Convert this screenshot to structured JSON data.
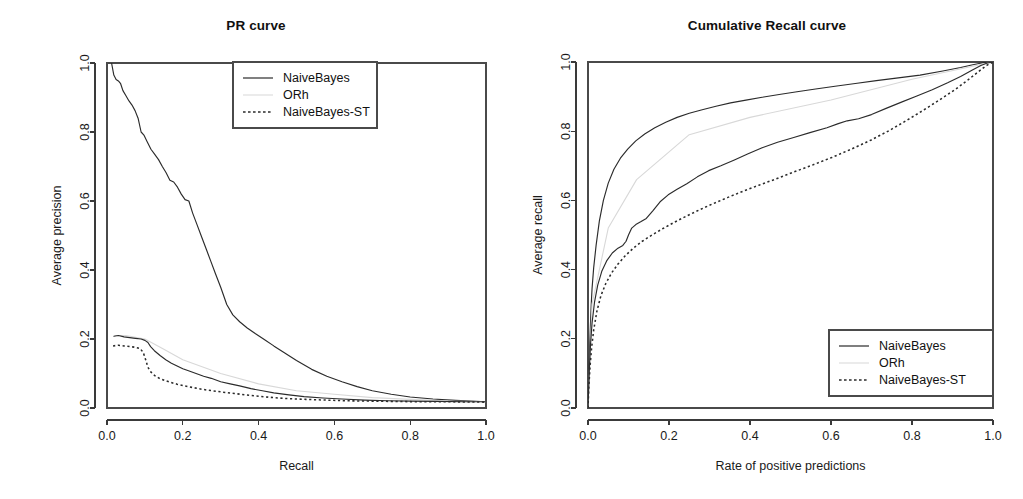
{
  "figure": {
    "background": "#ffffff",
    "foreground": "#1a1a1a",
    "panels": 2
  },
  "chart_data": [
    {
      "type": "line",
      "title": "PR curve",
      "xlabel": "Recall",
      "ylabel": "Average precision",
      "xlim": [
        0.0,
        1.0
      ],
      "ylim": [
        0.0,
        1.0
      ],
      "xticks": [
        "0.0",
        "0.2",
        "0.4",
        "0.6",
        "0.8",
        "1.0"
      ],
      "yticks": [
        "0.0",
        "0.2",
        "0.4",
        "0.6",
        "0.8",
        "1.0"
      ],
      "grid": false,
      "legend_position": "top-right",
      "legend": [
        "NaiveBayes",
        "ORh",
        "NaiveBayes-ST"
      ],
      "series": [
        {
          "name": "NaiveBayes",
          "style": "solid",
          "color": "#2b2b2b",
          "x": [
            0.012,
            0.018,
            0.024,
            0.03,
            0.036,
            0.042,
            0.05,
            0.058,
            0.066,
            0.074,
            0.082,
            0.09,
            0.098,
            0.106,
            0.116,
            0.126,
            0.136,
            0.146,
            0.156,
            0.166,
            0.176,
            0.186,
            0.196,
            0.206,
            0.216,
            0.226,
            0.238,
            0.25,
            0.262,
            0.274,
            0.286,
            0.3,
            0.316,
            0.332,
            0.35,
            0.37,
            0.392,
            0.416,
            0.44,
            0.468,
            0.5,
            0.54,
            0.58,
            0.62,
            0.66,
            0.7,
            0.75,
            0.8,
            0.86,
            0.92,
            1.0
          ],
          "y": [
            1.0,
            0.965,
            0.952,
            0.948,
            0.94,
            0.92,
            0.905,
            0.89,
            0.878,
            0.862,
            0.84,
            0.8,
            0.79,
            0.772,
            0.75,
            0.735,
            0.72,
            0.7,
            0.682,
            0.66,
            0.655,
            0.64,
            0.62,
            0.604,
            0.6,
            0.565,
            0.53,
            0.495,
            0.46,
            0.425,
            0.39,
            0.35,
            0.3,
            0.27,
            0.25,
            0.232,
            0.215,
            0.198,
            0.18,
            0.16,
            0.138,
            0.112,
            0.092,
            0.076,
            0.062,
            0.05,
            0.04,
            0.032,
            0.026,
            0.022,
            0.018
          ]
        },
        {
          "name": "ORh",
          "style": "faint",
          "color": "#d8d8d8",
          "x": [
            0.02,
            0.05,
            0.1,
            0.15,
            0.2,
            0.3,
            0.4,
            0.5,
            0.6,
            0.7,
            0.8,
            0.9,
            1.0
          ],
          "y": [
            0.21,
            0.21,
            0.2,
            0.17,
            0.14,
            0.1,
            0.07,
            0.05,
            0.04,
            0.03,
            0.025,
            0.02,
            0.018
          ]
        },
        {
          "name": "NaiveBayes-ST",
          "style": "solid-lower",
          "color": "#2b2b2b",
          "x": [
            0.018,
            0.03,
            0.045,
            0.06,
            0.075,
            0.09,
            0.1,
            0.108,
            0.115,
            0.125,
            0.14,
            0.155,
            0.17,
            0.185,
            0.2,
            0.215,
            0.235,
            0.255,
            0.275,
            0.3,
            0.325,
            0.35,
            0.38,
            0.41,
            0.44,
            0.48,
            0.52,
            0.57,
            0.62,
            0.68,
            0.74,
            0.8,
            0.87,
            0.94,
            1.0
          ],
          "y": [
            0.208,
            0.21,
            0.206,
            0.204,
            0.202,
            0.2,
            0.196,
            0.19,
            0.178,
            0.166,
            0.152,
            0.14,
            0.13,
            0.122,
            0.114,
            0.108,
            0.1,
            0.092,
            0.086,
            0.076,
            0.07,
            0.064,
            0.056,
            0.05,
            0.044,
            0.038,
            0.033,
            0.029,
            0.026,
            0.023,
            0.021,
            0.02,
            0.019,
            0.018,
            0.018
          ]
        },
        {
          "name": "NaiveBayes-ST-dashed",
          "style": "dashed",
          "color": "#2b2b2b",
          "x": [
            0.016,
            0.03,
            0.045,
            0.06,
            0.075,
            0.088,
            0.096,
            0.102,
            0.108,
            0.116,
            0.126,
            0.138,
            0.152,
            0.168,
            0.185,
            0.205,
            0.228,
            0.252,
            0.278,
            0.306,
            0.336,
            0.368,
            0.402,
            0.44,
            0.48,
            0.525,
            0.575,
            0.63,
            0.69,
            0.76,
            0.83,
            0.9,
            1.0
          ],
          "y": [
            0.18,
            0.182,
            0.18,
            0.178,
            0.176,
            0.172,
            0.16,
            0.14,
            0.118,
            0.104,
            0.094,
            0.086,
            0.08,
            0.074,
            0.069,
            0.064,
            0.059,
            0.054,
            0.05,
            0.046,
            0.042,
            0.038,
            0.034,
            0.03,
            0.027,
            0.025,
            0.023,
            0.021,
            0.02,
            0.019,
            0.018,
            0.018,
            0.017
          ]
        }
      ]
    },
    {
      "type": "line",
      "title": "Cumulative Recall curve",
      "xlabel": "Rate of positive predictions",
      "ylabel": "Average recall",
      "xlim": [
        0.0,
        1.0
      ],
      "ylim": [
        0.0,
        1.0
      ],
      "xticks": [
        "0.0",
        "0.2",
        "0.4",
        "0.6",
        "0.8",
        "1.0"
      ],
      "yticks": [
        "0.0",
        "0.2",
        "0.4",
        "0.6",
        "0.8",
        "1.0"
      ],
      "grid": false,
      "legend_position": "bottom-right",
      "legend": [
        "NaiveBayes",
        "ORh",
        "NaiveBayes-ST"
      ],
      "series": [
        {
          "name": "NaiveBayes",
          "style": "solid",
          "color": "#2b2b2b",
          "x": [
            0.0,
            0.002,
            0.004,
            0.006,
            0.008,
            0.01,
            0.014,
            0.02,
            0.028,
            0.038,
            0.05,
            0.064,
            0.08,
            0.098,
            0.118,
            0.14,
            0.165,
            0.192,
            0.22,
            0.25,
            0.282,
            0.316,
            0.352,
            0.39,
            0.43,
            0.472,
            0.516,
            0.562,
            0.61,
            0.66,
            0.712,
            0.766,
            0.82,
            0.876,
            0.92,
            0.95,
            0.975,
            1.0
          ],
          "y": [
            0.0,
            0.09,
            0.17,
            0.24,
            0.3,
            0.345,
            0.405,
            0.47,
            0.54,
            0.6,
            0.65,
            0.69,
            0.722,
            0.748,
            0.772,
            0.792,
            0.81,
            0.826,
            0.84,
            0.852,
            0.862,
            0.872,
            0.882,
            0.89,
            0.898,
            0.906,
            0.914,
            0.922,
            0.93,
            0.938,
            0.946,
            0.954,
            0.962,
            0.974,
            0.984,
            0.992,
            0.998,
            1.0
          ]
        },
        {
          "name": "ORh",
          "style": "faint",
          "color": "#d8d8d8",
          "x": [
            0.0,
            0.01,
            0.05,
            0.12,
            0.25,
            0.4,
            0.6,
            0.8,
            1.0
          ],
          "y": [
            0.0,
            0.3,
            0.52,
            0.66,
            0.79,
            0.84,
            0.89,
            0.95,
            1.0
          ]
        },
        {
          "name": "NaiveBayes-ST",
          "style": "solid-lower",
          "color": "#2b2b2b",
          "x": [
            0.0,
            0.002,
            0.004,
            0.006,
            0.01,
            0.016,
            0.024,
            0.034,
            0.046,
            0.06,
            0.074,
            0.086,
            0.094,
            0.1,
            0.108,
            0.118,
            0.13,
            0.144,
            0.16,
            0.178,
            0.198,
            0.22,
            0.244,
            0.27,
            0.298,
            0.328,
            0.36,
            0.394,
            0.43,
            0.468,
            0.508,
            0.548,
            0.59,
            0.618,
            0.64,
            0.668,
            0.7,
            0.736,
            0.774,
            0.812,
            0.85,
            0.888,
            0.92,
            0.948,
            0.97,
            0.986,
            1.0
          ],
          "y": [
            0.0,
            0.07,
            0.13,
            0.18,
            0.245,
            0.305,
            0.355,
            0.395,
            0.425,
            0.448,
            0.462,
            0.47,
            0.482,
            0.5,
            0.52,
            0.53,
            0.538,
            0.548,
            0.57,
            0.596,
            0.616,
            0.632,
            0.648,
            0.668,
            0.686,
            0.7,
            0.716,
            0.734,
            0.752,
            0.768,
            0.782,
            0.796,
            0.81,
            0.822,
            0.83,
            0.836,
            0.848,
            0.866,
            0.884,
            0.902,
            0.92,
            0.94,
            0.958,
            0.976,
            0.99,
            0.997,
            1.0
          ]
        },
        {
          "name": "NaiveBayes-ST-dashed",
          "style": "dashed",
          "color": "#2b2b2b",
          "x": [
            0.0,
            0.002,
            0.005,
            0.009,
            0.014,
            0.022,
            0.032,
            0.044,
            0.058,
            0.074,
            0.092,
            0.112,
            0.134,
            0.158,
            0.184,
            0.212,
            0.242,
            0.274,
            0.308,
            0.344,
            0.382,
            0.422,
            0.464,
            0.508,
            0.554,
            0.602,
            0.65,
            0.698,
            0.744,
            0.788,
            0.83,
            0.87,
            0.906,
            0.938,
            0.964,
            0.984,
            1.0
          ],
          "y": [
            0.0,
            0.06,
            0.12,
            0.175,
            0.225,
            0.28,
            0.325,
            0.36,
            0.39,
            0.416,
            0.44,
            0.462,
            0.482,
            0.5,
            0.518,
            0.536,
            0.554,
            0.572,
            0.59,
            0.608,
            0.626,
            0.644,
            0.662,
            0.682,
            0.702,
            0.724,
            0.748,
            0.774,
            0.802,
            0.832,
            0.862,
            0.892,
            0.92,
            0.948,
            0.972,
            0.99,
            1.0
          ]
        }
      ]
    }
  ]
}
